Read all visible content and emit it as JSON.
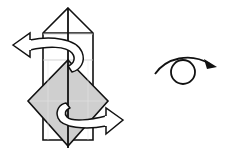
{
  "diagram": {
    "type": "origami-step",
    "colors": {
      "line": "#111111",
      "fill_paper": "#ffffff",
      "fill_shaded": "#cfcfcf",
      "crease": "#b0b0b0"
    },
    "elements": [
      {
        "name": "vertical-box",
        "shape": "tall rectangle with pointed top"
      },
      {
        "name": "gray-diamond",
        "shape": "square rotated 45 degrees, shaded"
      },
      {
        "name": "twist-arrow-top",
        "direction": "left"
      },
      {
        "name": "twist-arrow-bottom",
        "direction": "right"
      },
      {
        "name": "rotate-symbol",
        "meaning": "turn over / rotate"
      }
    ]
  }
}
